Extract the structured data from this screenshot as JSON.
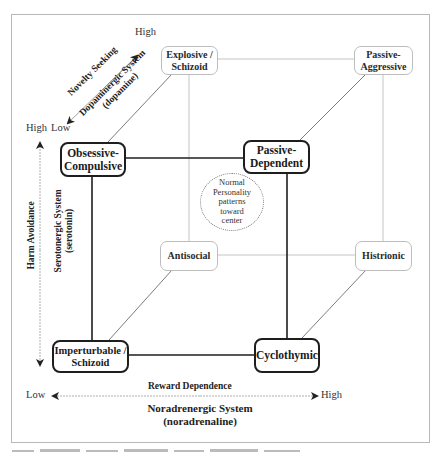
{
  "diagram": {
    "type": "3D personality cube (Cloninger model)",
    "colors": {
      "border": "#b8b8b8",
      "thin_edge": "#bdbdbd",
      "thick_edge": "#1e1e1e",
      "arrow": "#222222"
    },
    "nodes": {
      "explosive_schizoid": {
        "label": "Explosive /\nSchizoid",
        "weight": "thin"
      },
      "passive_aggressive": {
        "label": "Passive-\nAggressive",
        "weight": "thin"
      },
      "obsessive_compulsive": {
        "label": "Obsessive-\nCompulsive",
        "weight": "thick"
      },
      "passive_dependent": {
        "label": "Passive-\nDependent",
        "weight": "thick"
      },
      "antisocial": {
        "label": "Antisocial",
        "weight": "thin"
      },
      "histrionic": {
        "label": "Histrionic",
        "weight": "thin"
      },
      "imperturbable_schizoid": {
        "label": "Imperturbable /\nSchizoid",
        "weight": "thick"
      },
      "cyclothymic": {
        "label": "Cyclothymic",
        "weight": "thick"
      }
    },
    "center_note": "Normal\nPersonality\npatterns\ntoward\ncenter",
    "axes": {
      "novelty": {
        "name": "Novelty Seeking",
        "system": "Dopaminergic System",
        "neurotransmitter": "(dopamine)",
        "high": "High",
        "low": "Low"
      },
      "harm": {
        "name": "Harm Avoidance",
        "system": "Serotonergic System",
        "neurotransmitter": "(serotonin)",
        "high": "High",
        "low": "Low"
      },
      "reward": {
        "name": "Reward Dependence",
        "system": "Noradrenergic System",
        "neurotransmitter": "(noradrenaline)",
        "high": "High",
        "low": "Low"
      }
    }
  }
}
